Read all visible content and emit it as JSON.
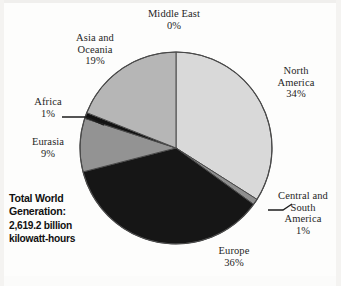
{
  "chart_data": {
    "type": "pie",
    "title": "",
    "total_label": "Total World Generation:",
    "total_value": "2,619.2 billion kilowatt-hours",
    "unit": "billion kilowatt-hours",
    "total_numeric": 2619.2,
    "categories": [
      "North America",
      "Central and South America",
      "Europe",
      "Eurasia",
      "Africa",
      "Asia and Oceania",
      "Middle East"
    ],
    "values": [
      34,
      1,
      36,
      9,
      1,
      19,
      0
    ],
    "slices": [
      {
        "name": "Middle East",
        "percent": 0,
        "label": "Middle East",
        "pct_text": "0%",
        "color": "#d9d9d9",
        "start_deg": 0,
        "sweep_deg": 0.0
      },
      {
        "name": "North America",
        "percent": 34,
        "label": "North America",
        "pct_text": "34%",
        "color": "#d9d9d9",
        "start_deg": 0,
        "sweep_deg": 122.4
      },
      {
        "name": "Central and South America",
        "percent": 1,
        "label": "Central and South America",
        "pct_text": "1%",
        "color": "#8f8f8f",
        "start_deg": 122.4,
        "sweep_deg": 3.6
      },
      {
        "name": "Europe",
        "percent": 36,
        "label": "Europe",
        "pct_text": "36%",
        "color": "#161616",
        "start_deg": 126.0,
        "sweep_deg": 129.6
      },
      {
        "name": "Eurasia",
        "percent": 9,
        "label": "Eurasia",
        "pct_text": "9%",
        "color": "#939393",
        "start_deg": 255.6,
        "sweep_deg": 32.4
      },
      {
        "name": "Africa",
        "percent": 1,
        "label": "Africa",
        "pct_text": "1%",
        "color": "#121212",
        "start_deg": 288.0,
        "sweep_deg": 3.6
      },
      {
        "name": "Asia and Oceania",
        "percent": 19,
        "label": "Asia and Oceania",
        "pct_text": "19%",
        "color": "#b6b6b6",
        "start_deg": 291.6,
        "sweep_deg": 68.4
      }
    ],
    "legend_position": "callout-labels",
    "grid": false,
    "ylabel": "",
    "xlabel": ""
  },
  "labels": {
    "middle_east": {
      "line1": "Middle East",
      "pct": "0%"
    },
    "asia_oceania": {
      "line1": "Asia and",
      "line2": "Oceania",
      "pct": "19%"
    },
    "north_america": {
      "line1": "North",
      "line2": "America",
      "pct": "34%"
    },
    "africa": {
      "line1": "Africa",
      "pct": "1%"
    },
    "eurasia": {
      "line1": "Eurasia",
      "pct": "9%"
    },
    "central_south": {
      "line1": "Central and",
      "line2": "South",
      "line3": "America",
      "pct": "1%"
    },
    "europe": {
      "line1": "Europe",
      "pct": "36%"
    }
  },
  "total": {
    "line1": "Total World",
    "line2": "Generation:",
    "line3": "2,619.2 billion",
    "line4": "kilowatt-hours"
  },
  "colors": {
    "north_america": "#d9d9d9",
    "central_south": "#8f8f8f",
    "europe": "#161616",
    "eurasia": "#939393",
    "africa": "#121212",
    "asia_oceania": "#b6b6b6",
    "middle_east": "#d9d9d9",
    "outline": "#4a4a4a",
    "background": "#fdfdfc"
  }
}
